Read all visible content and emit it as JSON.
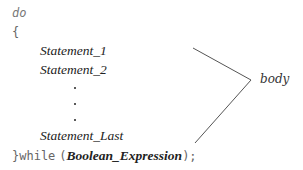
{
  "code": {
    "keyword_do": "do",
    "open_brace": "{",
    "statements": [
      "Statement_1",
      "Statement_2",
      "Statement_Last"
    ],
    "close_while": "}while",
    "open_paren": "(",
    "condition": "Boolean_Expression",
    "close_paren_semicolon": ");"
  },
  "annotation": {
    "label": "body"
  },
  "colors": {
    "keyword": "#777777",
    "text": "#222222",
    "line": "#555555"
  }
}
